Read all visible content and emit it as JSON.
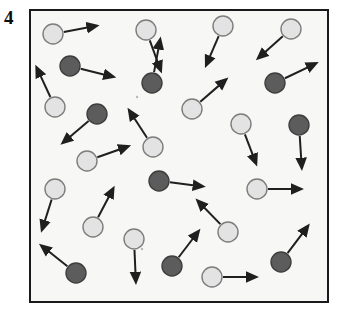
{
  "figure": {
    "panel_label": "4",
    "caption": "",
    "type": "particle-motion-diagram"
  },
  "box": {
    "x": 29,
    "y": 9,
    "width": 300,
    "height": 294,
    "fill_color": "#f7f7f5",
    "border_color": "#1a1a1a",
    "border_width": 2
  },
  "legend": {
    "species": [
      {
        "name": "light-particle",
        "fill_color": "#e3e3e3",
        "stroke_color": "#7d7d7d",
        "radius": 10,
        "count": 17
      },
      {
        "name": "dark-particle",
        "fill_color": "#5c5c5c",
        "stroke_color": "#3d3d3d",
        "radius": 10,
        "count": 11
      }
    ],
    "arrow_color": "#1f1f1f"
  },
  "chart_data": {
    "type": "scatter",
    "title": "4",
    "xlabel": "",
    "ylabel": "",
    "xlim": [
      0,
      300
    ],
    "ylim": [
      0,
      294
    ],
    "grid": false,
    "legend_position": "none",
    "particles": [
      {
        "id": 1,
        "species": "light",
        "x": 24,
        "y": 25,
        "vx": 48,
        "vy": -9
      },
      {
        "id": 2,
        "species": "light",
        "x": 117,
        "y": 21,
        "vx": 16,
        "vy": 44
      },
      {
        "id": 3,
        "species": "light",
        "x": 194,
        "y": 17,
        "vx": -18,
        "vy": 42
      },
      {
        "id": 4,
        "species": "light",
        "x": 262,
        "y": 20,
        "vx": -36,
        "vy": 32
      },
      {
        "id": 5,
        "species": "dark",
        "x": 41,
        "y": 57,
        "vx": 48,
        "vy": 12
      },
      {
        "id": 6,
        "species": "dark",
        "x": 123,
        "y": 74,
        "vx": 9,
        "vy": -48
      },
      {
        "id": 7,
        "species": "dark",
        "x": 246,
        "y": 74,
        "vx": 46,
        "vy": -22
      },
      {
        "id": 8,
        "species": "light",
        "x": 26,
        "y": 98,
        "vx": -20,
        "vy": -43
      },
      {
        "id": 9,
        "species": "dark",
        "x": 68,
        "y": 105,
        "vx": -38,
        "vy": 32
      },
      {
        "id": 10,
        "species": "light",
        "x": 163,
        "y": 100,
        "vx": 38,
        "vy": -33
      },
      {
        "id": 11,
        "species": "light",
        "x": 212,
        "y": 115,
        "vx": 16,
        "vy": 42
      },
      {
        "id": 12,
        "species": "dark",
        "x": 270,
        "y": 116,
        "vx": 3,
        "vy": 46
      },
      {
        "id": 13,
        "species": "light",
        "x": 124,
        "y": 138,
        "vx": -26,
        "vy": -40
      },
      {
        "id": 14,
        "species": "light",
        "x": 58,
        "y": 152,
        "vx": 45,
        "vy": -16
      },
      {
        "id": 15,
        "species": "light",
        "x": 26,
        "y": 180,
        "vx": -14,
        "vy": 44
      },
      {
        "id": 16,
        "species": "dark",
        "x": 130,
        "y": 172,
        "vx": 48,
        "vy": 6
      },
      {
        "id": 17,
        "species": "light",
        "x": 228,
        "y": 180,
        "vx": 48,
        "vy": 0
      },
      {
        "id": 18,
        "species": "light",
        "x": 64,
        "y": 218,
        "vx": 22,
        "vy": -42
      },
      {
        "id": 19,
        "species": "light",
        "x": 105,
        "y": 230,
        "vx": 2,
        "vy": 46
      },
      {
        "id": 20,
        "species": "light",
        "x": 199,
        "y": 223,
        "vx": -33,
        "vy": -34
      },
      {
        "id": 21,
        "species": "dark",
        "x": 47,
        "y": 264,
        "vx": -38,
        "vy": -30
      },
      {
        "id": 22,
        "species": "dark",
        "x": 143,
        "y": 257,
        "vx": 29,
        "vy": -38
      },
      {
        "id": 23,
        "species": "light",
        "x": 183,
        "y": 268,
        "vx": 48,
        "vy": 0
      },
      {
        "id": 24,
        "species": "dark",
        "x": 252,
        "y": 253,
        "vx": 30,
        "vy": -40
      }
    ]
  }
}
